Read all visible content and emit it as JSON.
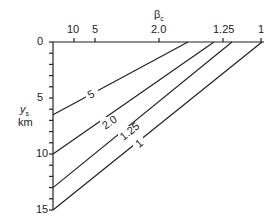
{
  "diagram": {
    "top_axis": {
      "title": "β",
      "title_subscript": "c",
      "ticks": [
        {
          "label": "10",
          "x": 74
        },
        {
          "label": "5",
          "x": 95
        },
        {
          "label": "2.0",
          "x": 159
        },
        {
          "label": "1.25",
          "x": 223
        },
        {
          "label": "1",
          "x": 261
        }
      ]
    },
    "left_axis": {
      "title": "y",
      "title_subscript": "s",
      "unit": "km",
      "tick_labels": [
        {
          "label": "0",
          "value": 0
        },
        {
          "label": "5",
          "value": 5
        },
        {
          "label": "10",
          "value": 10
        },
        {
          "label": "15",
          "value": 15
        }
      ],
      "range": [
        0,
        15
      ]
    },
    "lines": [
      {
        "label": "5",
        "top_x": 188,
        "left_y": 6.5
      },
      {
        "label": "2.0",
        "top_x": 214,
        "left_y": 10
      },
      {
        "label": "1.25",
        "top_x": 232,
        "left_y": 13
      },
      {
        "label": "1",
        "top_x": 262,
        "left_y": 15
      }
    ],
    "colors": {
      "line": "#222222",
      "text": "#222222"
    }
  }
}
